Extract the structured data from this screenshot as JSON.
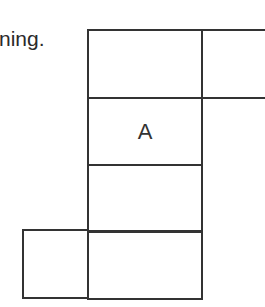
{
  "caption": {
    "text": "ning."
  },
  "net": {
    "line_color": "#333333",
    "cells": [
      {
        "id": "top-center",
        "label": ""
      },
      {
        "id": "top-right",
        "label": ""
      },
      {
        "id": "middle-a",
        "label": "A"
      },
      {
        "id": "lower-center",
        "label": ""
      },
      {
        "id": "bottom-center",
        "label": ""
      },
      {
        "id": "bottom-left",
        "label": ""
      }
    ]
  }
}
